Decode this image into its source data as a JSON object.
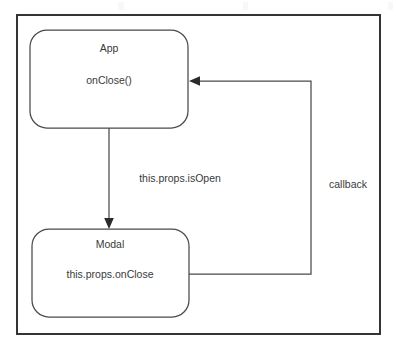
{
  "diagram": {
    "type": "flowchart",
    "title_visible": false,
    "background_color": "#ffffff",
    "frame": {
      "name": "outer-frame",
      "x": 17,
      "y": 15,
      "width": 363,
      "height": 319,
      "stroke_color": "#2b2b2b"
    },
    "nodes": [
      {
        "id": "app",
        "label": "App",
        "sublabel": "onClose()",
        "shape": "rounded-rectangle",
        "x": 30,
        "y": 30,
        "width": 158,
        "height": 98,
        "stroke_color": "#4a4a4a",
        "fill_color": "#ffffff"
      },
      {
        "id": "modal",
        "label": "Modal",
        "sublabel": "this.props.onClose",
        "shape": "rounded-rectangle",
        "x": 32,
        "y": 229,
        "width": 157,
        "height": 88,
        "stroke_color": "#4a4a4a",
        "fill_color": "#ffffff"
      }
    ],
    "edges": [
      {
        "id": "app-to-modal",
        "from": "app",
        "to": "modal",
        "label": "this.props.isOpen",
        "label_x": 180,
        "label_y": 179,
        "arrow": "to-modal",
        "path": "M 109 128 L 109 227"
      },
      {
        "id": "modal-to-app",
        "from": "modal",
        "to": "app",
        "label": "callback",
        "label_x": 348,
        "label_y": 185,
        "arrow": "to-app",
        "path": "M 189 274 L 311 274 L 311 81 L 190 81"
      }
    ]
  },
  "text_elements": {
    "app_title": "App",
    "app_method": "onClose()",
    "modal_title": "Modal",
    "modal_prop": "this.props.onClose",
    "edge_label_isopen": "this.props.isOpen",
    "edge_label_callback": "callback"
  }
}
